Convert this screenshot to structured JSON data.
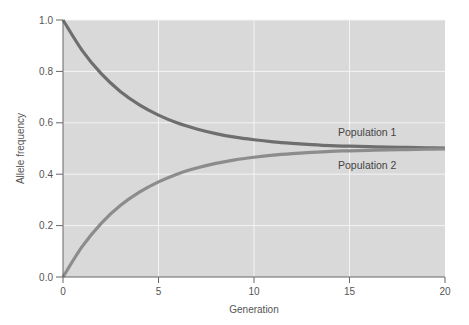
{
  "chart_data": {
    "type": "line",
    "title": "",
    "xlabel": "Generation",
    "ylabel": "Allele frequency",
    "xlim": [
      0,
      20
    ],
    "ylim": [
      0,
      1.0
    ],
    "x_ticks": [
      0,
      5,
      10,
      15,
      20
    ],
    "x_tick_labels": [
      "0",
      "5",
      "10",
      "15",
      "20"
    ],
    "y_ticks": [
      0.0,
      0.2,
      0.4,
      0.6,
      0.8,
      1.0
    ],
    "y_tick_labels": [
      "0.0",
      "0.2",
      "0.4",
      "0.6",
      "0.8",
      "1.0"
    ],
    "grid": true,
    "legend": "inline labels near right end of curves",
    "x": [
      0,
      1,
      2,
      3,
      4,
      5,
      6,
      7,
      8,
      9,
      10,
      11,
      12,
      13,
      14,
      15,
      16,
      17,
      18,
      19,
      20
    ],
    "series": [
      {
        "name": "Population 1",
        "color": "#6e6e6e",
        "values": [
          1.0,
          0.882,
          0.791,
          0.722,
          0.67,
          0.63,
          0.599,
          0.576,
          0.558,
          0.544,
          0.534,
          0.526,
          0.52,
          0.515,
          0.511,
          0.509,
          0.507,
          0.505,
          0.504,
          0.503,
          0.502
        ]
      },
      {
        "name": "Population 2",
        "color": "#8c8c8c",
        "values": [
          0.0,
          0.118,
          0.209,
          0.278,
          0.33,
          0.37,
          0.401,
          0.424,
          0.442,
          0.456,
          0.466,
          0.474,
          0.48,
          0.485,
          0.489,
          0.491,
          0.493,
          0.495,
          0.496,
          0.497,
          0.498
        ]
      }
    ],
    "annotations": [
      {
        "text": "Population 1",
        "x": 14.4,
        "y": 0.565
      },
      {
        "text": "Population 2",
        "x": 14.4,
        "y": 0.435
      }
    ]
  },
  "colors": {
    "plot_background": "#d9d9d9",
    "gridline": "#f4f4f4",
    "axis": "#666666"
  }
}
